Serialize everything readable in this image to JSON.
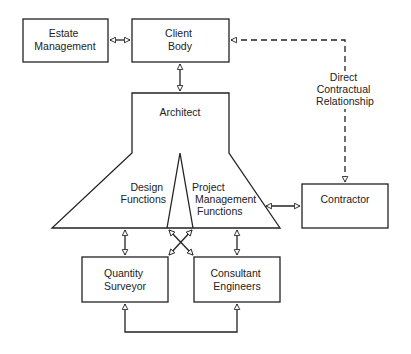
{
  "diagram": {
    "type": "organisational-relationship",
    "colors": {
      "line": "#222222",
      "background": "#ffffff"
    },
    "nodes": {
      "estate_management": {
        "lines": [
          "Estate",
          "Management"
        ]
      },
      "client_body": {
        "lines": [
          "Client",
          "Body"
        ]
      },
      "architect": {
        "title": "Architect"
      },
      "design_functions": {
        "lines": [
          "Design",
          "Functions"
        ]
      },
      "project_management_functions": {
        "lines": [
          "Project",
          "Management",
          "Functions"
        ]
      },
      "contractor": {
        "lines": [
          "Contractor"
        ]
      },
      "quantity_surveyor": {
        "lines": [
          "Quantity",
          "Surveyor"
        ]
      },
      "consultant_engineers": {
        "lines": [
          "Consultant",
          "Engineers"
        ]
      }
    },
    "edge_labels": {
      "direct_contractual": {
        "lines": [
          "Direct",
          "Contractual",
          "Relationship"
        ]
      }
    },
    "edges": [
      {
        "from": "Estate Management",
        "to": "Client Body",
        "style": "solid",
        "arrows": "both"
      },
      {
        "from": "Client Body",
        "to": "Architect",
        "style": "solid",
        "arrows": "both"
      },
      {
        "from": "Contractor",
        "to": "Client Body",
        "style": "dashed",
        "arrows": "both",
        "label": "Direct Contractual Relationship"
      },
      {
        "from": "Architect",
        "to": "Contractor",
        "style": "solid",
        "arrows": "both"
      },
      {
        "from": "Design Functions",
        "to": "Quantity Surveyor",
        "style": "solid",
        "arrows": "both"
      },
      {
        "from": "Project Management Functions",
        "to": "Consultant Engineers",
        "style": "solid",
        "arrows": "both"
      },
      {
        "from": "Design Functions",
        "to": "Consultant Engineers",
        "style": "solid",
        "arrows": "both"
      },
      {
        "from": "Project Management Functions",
        "to": "Quantity Surveyor",
        "style": "solid",
        "arrows": "both"
      },
      {
        "from": "Quantity Surveyor",
        "to": "Consultant Engineers",
        "style": "solid",
        "arrows": "both"
      }
    ]
  }
}
